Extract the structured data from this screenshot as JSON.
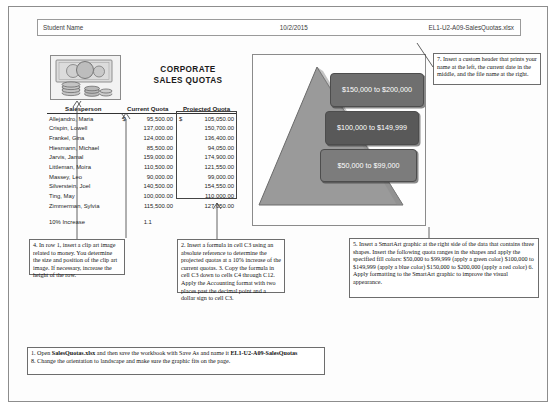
{
  "header": {
    "student_name": "Student Name",
    "date": "10/2/2015",
    "file_name": "EL1-U2-A09-SalesQuotas.xlsx"
  },
  "worksheet": {
    "title_line1": "CORPORATE",
    "title_line2": "SALES QUOTAS",
    "clipart_name": "money-clip-art",
    "columns": [
      "Salesperson",
      "Current Quota",
      "Projected Quota"
    ],
    "rows": [
      {
        "salesperson": "Allejandro, Maria",
        "current": "95,500.00",
        "current_symbol": "$",
        "projected": "105,050.00",
        "projected_symbol": "$"
      },
      {
        "salesperson": "Crispin, Lowell",
        "current": "137,000.00",
        "current_symbol": "",
        "projected": "150,700.00",
        "projected_symbol": ""
      },
      {
        "salesperson": "Frankel, Gina",
        "current": "124,000.00",
        "current_symbol": "",
        "projected": "136,400.00",
        "projected_symbol": ""
      },
      {
        "salesperson": "Hiesmann, Michael",
        "current": "85,500.00",
        "current_symbol": "",
        "projected": "94,050.00",
        "projected_symbol": ""
      },
      {
        "salesperson": "Jarvis, Jamal",
        "current": "159,000.00",
        "current_symbol": "",
        "projected": "174,900.00",
        "projected_symbol": ""
      },
      {
        "salesperson": "Littleman, Moira",
        "current": "110,500.00",
        "current_symbol": "",
        "projected": "121,550.00",
        "projected_symbol": ""
      },
      {
        "salesperson": "Massey, Leo",
        "current": "90,000.00",
        "current_symbol": "",
        "projected": "99,000.00",
        "projected_symbol": ""
      },
      {
        "salesperson": "Silverstein, Joel",
        "current": "140,500.00",
        "current_symbol": "",
        "projected": "154,550.00",
        "projected_symbol": ""
      },
      {
        "salesperson": "Ting, May",
        "current": "100,000.00",
        "current_symbol": "",
        "projected": "110,000.00",
        "projected_symbol": ""
      },
      {
        "salesperson": "Zimmerman, Sylvia",
        "current": "115,500.00",
        "current_symbol": "",
        "projected": "127,050.00",
        "projected_symbol": ""
      }
    ],
    "footer_label": "10% Increase",
    "footer_value": "1.1"
  },
  "smartart": {
    "name": "pyramid-smartart",
    "shapes": [
      {
        "label": "$150,000 to $200,000",
        "fill": "#6f6f6f"
      },
      {
        "label": "$100,000 to $149,999",
        "fill": "#595959"
      },
      {
        "label": "$50,000 to $99,000",
        "fill": "#7c7c7c"
      }
    ]
  },
  "callouts": {
    "clip_art": "4. In row 1, insert a clip art image related to money. You determine the size and position of the clip art image. If necessary, increase the height of the row.",
    "formula": "2. Insert a formula in cell C3 using an absolute reference to determine the projected quotas at a 10% increase of the current quotas.\n3. Copy the formula in cell C3 down to cells C4 through C12. Apply the Accounting format with two places past the decimal point and a dollar sign to cell C3.",
    "custom_header": "7. Insert a custom header that prints your name at the left, the current date in the middle, and the file name at the right.",
    "smartart_instructions": "5. Insert a SmartArt graphic at the right side of the data that contains three shapes. Insert the following quota ranges in the shapes and apply the specified fill colors: $50,000 to $99,999 (apply a green color) $100,000 to $149,999 (apply a blue color) $150,000 to $200,000 (apply a red color)\n6. Apply formatting to the SmartArt graphic to improve the visual appearance.",
    "open_save_prefix": "1. Open ",
    "open_save_file": "SalesQuotas.xlsx",
    "open_save_mid": " and then save the workbook with Save As and name it ",
    "open_save_newname": "EL1-U2-A09-SalesQuotas",
    "orientation": "8. Change the orientation to landscape and make sure the graphic fits on the page."
  }
}
